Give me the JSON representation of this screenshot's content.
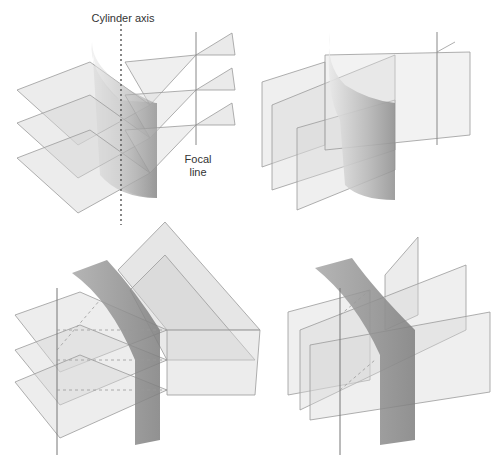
{
  "figure": {
    "panels": [
      {
        "id": "top-left",
        "description": "Cylindrical lens with horizontal planes converging to focal line"
      },
      {
        "id": "top-right",
        "description": "Cylindrical lens with vertical planes passing through unchanged"
      },
      {
        "id": "bottom-left",
        "description": "Cylinder (rotated) with horizontal planes"
      },
      {
        "id": "bottom-right",
        "description": "Cylinder (rotated) with vertical planes"
      }
    ],
    "labels": {
      "cylinder_axis": "Cylinder axis",
      "focal_line_1": "Focal",
      "focal_line_2": "line"
    },
    "colors": {
      "plane_fill": "#d9d9d9",
      "plane_stroke": "#9a9a9a",
      "lens_dark": "#8a8a8a",
      "lens_light": "#e6e6e6",
      "axis_line": "#555555"
    }
  }
}
